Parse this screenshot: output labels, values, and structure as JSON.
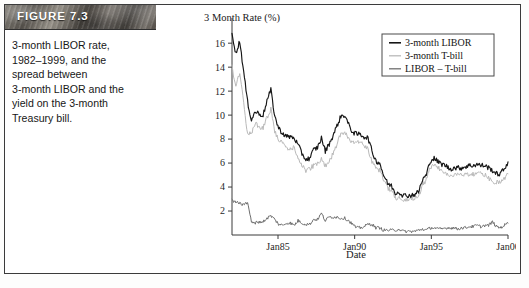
{
  "figure": {
    "label": "FIGURE 7.3",
    "caption_lines": [
      "3-month LIBOR rate,",
      "1982–1999, and the",
      "spread between",
      "3-month LIBOR and the",
      "yield on the 3-month",
      "Treasury bill."
    ]
  },
  "colors": {
    "libor": "#161616",
    "tbill": "#b9b9b9",
    "spread": "#6e6e6e",
    "axis": "#3a3a3a",
    "banner_text": "#ffffff"
  },
  "chart_data": {
    "type": "line",
    "title": "3 Month Rate (%)",
    "ylabel": "3 Month Rate (%)",
    "xlabel": "Date",
    "grid": false,
    "legend_position": "top-right",
    "ylim": [
      0,
      17.6
    ],
    "yticks": [
      2,
      4,
      6,
      8,
      10,
      12,
      14,
      16
    ],
    "ytick_labels": [
      "2",
      "4",
      "6",
      "8",
      "10",
      "12",
      "14",
      "16"
    ],
    "xlim": [
      "Jan82",
      "Dec99"
    ],
    "xticks": [
      "Jan85",
      "Jan90",
      "Jan95",
      "Jan00"
    ],
    "xtick_labels": [
      "Jan85",
      "Jan90",
      "Jan95",
      "Jan00"
    ],
    "legend": [
      "3-month LIBOR",
      "3-month T-bill",
      "LIBOR – T-bill"
    ],
    "x": [
      "1982.0",
      "1982.25",
      "1982.5",
      "1982.75",
      "1983.0",
      "1983.25",
      "1983.5",
      "1983.75",
      "1984.0",
      "1984.25",
      "1984.5",
      "1984.75",
      "1985.0",
      "1985.25",
      "1985.5",
      "1985.75",
      "1986.0",
      "1986.25",
      "1986.5",
      "1986.75",
      "1987.0",
      "1987.25",
      "1987.5",
      "1987.75",
      "1988.0",
      "1988.25",
      "1988.5",
      "1988.75",
      "1989.0",
      "1989.25",
      "1989.5",
      "1989.75",
      "1990.0",
      "1990.25",
      "1990.5",
      "1990.75",
      "1991.0",
      "1991.25",
      "1991.5",
      "1991.75",
      "1992.0",
      "1992.25",
      "1992.5",
      "1992.75",
      "1993.0",
      "1993.25",
      "1993.5",
      "1993.75",
      "1994.0",
      "1994.25",
      "1994.5",
      "1994.75",
      "1995.0",
      "1995.25",
      "1995.5",
      "1995.75",
      "1996.0",
      "1996.25",
      "1996.5",
      "1996.75",
      "1997.0",
      "1997.25",
      "1997.5",
      "1997.75",
      "1998.0",
      "1998.25",
      "1998.5",
      "1998.75",
      "1999.0",
      "1999.25",
      "1999.5",
      "1999.75"
    ],
    "series": [
      {
        "name": "3-month LIBOR",
        "color": "#161616",
        "values": [
          16.9,
          15.1,
          16.2,
          13.6,
          11.1,
          9.6,
          10.3,
          10.1,
          10.0,
          11.2,
          12.1,
          9.9,
          8.9,
          8.5,
          8.2,
          8.2,
          8.1,
          7.5,
          6.8,
          6.3,
          6.4,
          7.1,
          7.3,
          8.1,
          7.0,
          7.6,
          8.3,
          9.1,
          9.9,
          10.0,
          9.2,
          8.6,
          8.4,
          8.4,
          8.2,
          8.1,
          7.0,
          6.2,
          6.0,
          5.0,
          4.3,
          4.1,
          3.5,
          3.6,
          3.3,
          3.3,
          3.3,
          3.4,
          3.6,
          4.6,
          5.0,
          6.2,
          6.4,
          6.1,
          5.9,
          5.8,
          5.5,
          5.6,
          5.6,
          5.6,
          5.7,
          5.8,
          5.8,
          5.9,
          5.8,
          5.8,
          5.6,
          5.4,
          5.1,
          5.1,
          5.5,
          6.1
        ]
      },
      {
        "name": "3-month T-bill",
        "color": "#b9b9b9",
        "values": [
          14.0,
          12.4,
          13.5,
          11.1,
          8.4,
          8.5,
          9.3,
          9.0,
          8.9,
          9.8,
          10.5,
          8.6,
          8.0,
          7.7,
          7.2,
          7.2,
          7.3,
          6.3,
          5.8,
          5.4,
          5.5,
          5.8,
          6.0,
          6.3,
          5.8,
          6.1,
          6.8,
          7.6,
          8.5,
          8.6,
          8.0,
          7.7,
          7.8,
          7.8,
          7.5,
          7.2,
          6.1,
          5.6,
          5.4,
          4.6,
          3.9,
          3.7,
          3.1,
          3.1,
          3.0,
          3.0,
          3.0,
          3.1,
          3.2,
          4.1,
          4.6,
          5.6,
          5.8,
          5.6,
          5.4,
          5.2,
          4.9,
          5.0,
          5.1,
          5.0,
          5.1,
          5.1,
          5.1,
          5.1,
          5.1,
          5.0,
          4.8,
          4.3,
          4.4,
          4.5,
          4.7,
          5.1
        ]
      },
      {
        "name": "LIBOR – T-bill",
        "color": "#6e6e6e",
        "values": [
          2.9,
          2.7,
          2.7,
          2.5,
          2.7,
          1.1,
          1.0,
          1.1,
          1.1,
          1.4,
          1.6,
          1.3,
          0.9,
          0.8,
          1.0,
          1.0,
          0.8,
          1.2,
          1.0,
          0.9,
          0.9,
          1.3,
          1.3,
          1.8,
          1.2,
          1.5,
          1.5,
          1.5,
          1.4,
          1.4,
          1.2,
          0.9,
          0.6,
          0.6,
          0.7,
          0.9,
          0.9,
          0.6,
          0.6,
          0.4,
          0.4,
          0.4,
          0.4,
          0.5,
          0.3,
          0.3,
          0.3,
          0.3,
          0.4,
          0.5,
          0.4,
          0.6,
          0.6,
          0.5,
          0.5,
          0.6,
          0.6,
          0.6,
          0.5,
          0.6,
          0.6,
          0.7,
          0.7,
          0.8,
          0.7,
          0.8,
          0.8,
          1.1,
          0.7,
          0.6,
          0.8,
          1.0
        ]
      }
    ]
  }
}
